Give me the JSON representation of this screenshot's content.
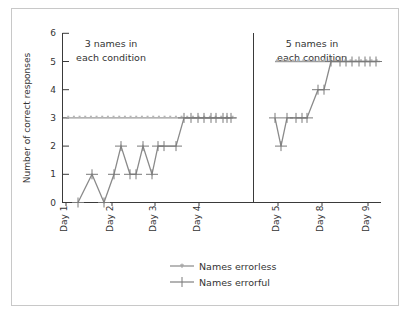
{
  "chart_data": {
    "type": "line",
    "ylabel": "Number of correct responses",
    "ylim": [
      0,
      6
    ],
    "yticks": [
      0,
      1,
      2,
      3,
      4,
      5,
      6
    ],
    "grid": false,
    "legend_position": "bottom-center",
    "legend": [
      {
        "name": "Names errorless",
        "marker": "small-star",
        "color": "#a8a8a8"
      },
      {
        "name": "Names errorful",
        "marker": "plus",
        "color": "#808080"
      }
    ],
    "panels": [
      {
        "title": "3 names in each condition",
        "xtick_labels": [
          "Day 1",
          "Day 2",
          "Day 3",
          "Day 4"
        ],
        "series": [
          {
            "name": "Names errorless",
            "values": [
              3,
              3,
              3,
              3,
              3,
              3,
              3,
              3,
              3,
              3,
              3,
              3,
              3,
              3,
              3,
              3,
              3,
              3,
              3,
              3,
              3,
              3,
              3,
              3,
              3,
              3,
              3,
              3,
              3,
              3
            ]
          },
          {
            "name": "Names errorful",
            "values": [
              0,
              1,
              0,
              1,
              2,
              1,
              1,
              2,
              1,
              2,
              2,
              2,
              3,
              3,
              3,
              3,
              3,
              3,
              3,
              3,
              3
            ]
          }
        ]
      },
      {
        "title": "5 names in each condition",
        "xtick_labels": [
          "Day 5",
          "Day 8",
          "Day 9"
        ],
        "series": [
          {
            "name": "Names errorless",
            "values": [
              5,
              5,
              5,
              5,
              5,
              5,
              5,
              5,
              5,
              5,
              5,
              5,
              5,
              5,
              5,
              5,
              5,
              5,
              5,
              5
            ]
          },
          {
            "name": "Names errorful",
            "values": [
              3,
              2,
              3,
              3,
              3,
              3,
              4,
              4,
              5,
              5,
              5,
              5,
              5,
              5,
              5,
              5
            ]
          }
        ]
      }
    ]
  },
  "ui": {
    "ylabel": "Number of correct responses",
    "yticks": [
      "0",
      "1",
      "2",
      "3",
      "4",
      "5",
      "6"
    ],
    "left_title_line1": "3 names in",
    "left_title_line2": "each condition",
    "right_title_line1": "5 names in",
    "right_title_line2": "each condition",
    "left_days": [
      "Day 1",
      "Day 2",
      "Day 3",
      "Day 4"
    ],
    "right_days": [
      "Day 5",
      "Day 8",
      "Day 9"
    ],
    "legend_errorless": "Names errorless",
    "legend_errorful": "Names errorful"
  }
}
